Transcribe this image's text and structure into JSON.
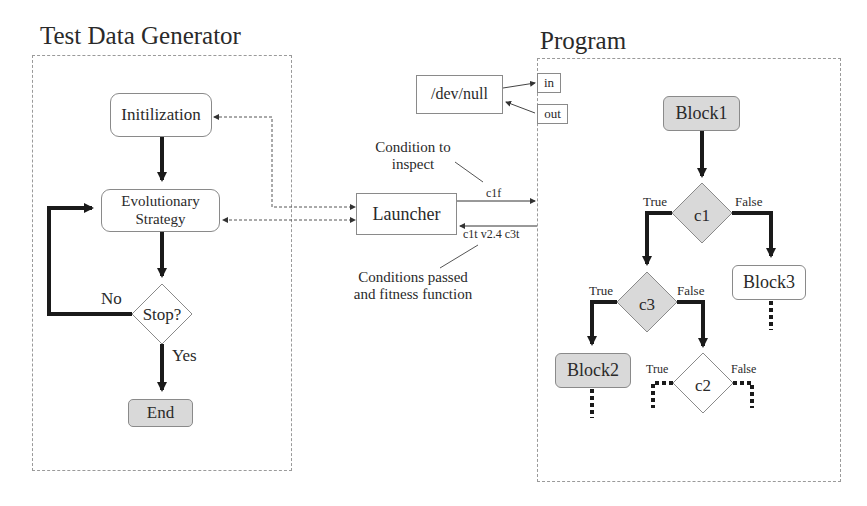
{
  "test_data_generator": {
    "title": "Test Data Generator",
    "nodes": {
      "init": "Initilization",
      "evo_line1": "Evolutionary",
      "evo_line2": "Strategy",
      "stop": "Stop?",
      "end": "End"
    },
    "edges": {
      "no": "No",
      "yes": "Yes"
    }
  },
  "middle": {
    "launcher": "Launcher",
    "devnull": "/dev/null",
    "condition_to_inspect_line1": "Condition to",
    "condition_to_inspect_line2": "inspect",
    "sent_condition": "c1f",
    "returned_conditions": "c1t v2.4 c3t",
    "conditions_passed_line1": "Conditions passed",
    "conditions_passed_line2": "and fitness function"
  },
  "program": {
    "title": "Program",
    "ports": {
      "in": "in",
      "out": "out"
    },
    "nodes": {
      "block1": "Block1",
      "c1": "c1",
      "block3": "Block3",
      "c3": "c3",
      "block2": "Block2",
      "c2": "c2"
    },
    "edges": {
      "c1_true": "True",
      "c1_false": "False",
      "c3_true": "True",
      "c3_false": "False",
      "c2_true": "True",
      "c2_false": "False"
    }
  },
  "colors": {
    "grey_fill": "#d9d9d9",
    "line": "#1a1a1a",
    "border": "#8a8a8a",
    "dashed_border": "#9a9a9a"
  }
}
